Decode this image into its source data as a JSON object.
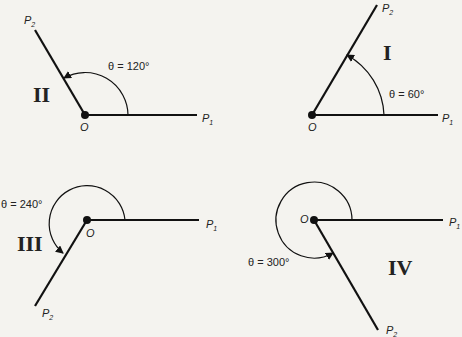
{
  "panels": [
    {
      "quadrant": "II",
      "theta_label": "θ = 120°",
      "origin": "O",
      "p1": "P",
      "p1_sub": "1",
      "p2": "P",
      "p2_sub": "2"
    },
    {
      "quadrant": "I",
      "theta_label": "θ = 60°",
      "origin": "O",
      "p1": "P",
      "p1_sub": "1",
      "p2": "P",
      "p2_sub": "2"
    },
    {
      "quadrant": "III",
      "theta_label": "θ = 240°",
      "origin": "O",
      "p1": "P",
      "p1_sub": "1",
      "p2": "P",
      "p2_sub": "2"
    },
    {
      "quadrant": "IV",
      "theta_label": "θ = 300°",
      "origin": "O",
      "p1": "P",
      "p1_sub": "1",
      "p2": "P",
      "p2_sub": "2"
    }
  ],
  "colors": {
    "ink": "#111111",
    "background": "#f4f3ef"
  }
}
